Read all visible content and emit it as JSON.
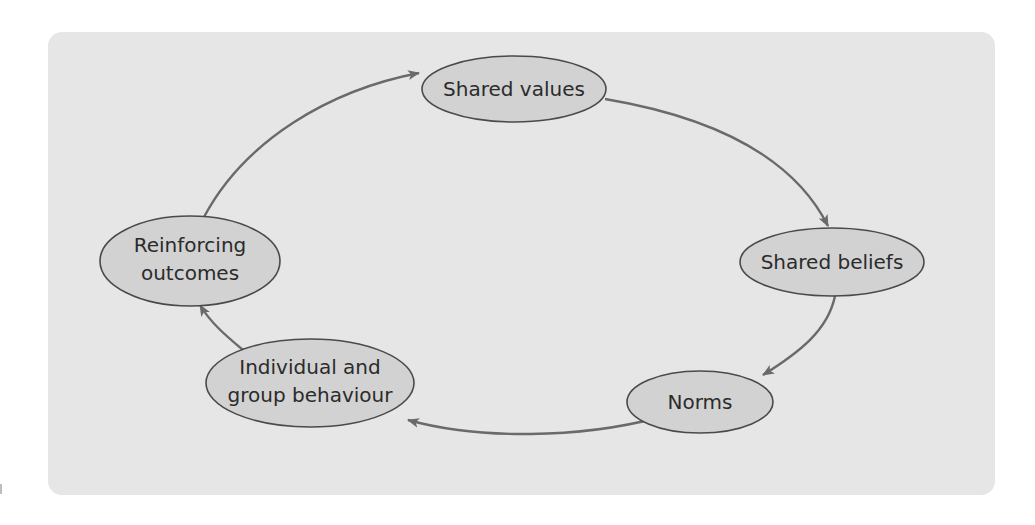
{
  "diagram": {
    "type": "cycle",
    "colors": {
      "panel": "#e6e6e6",
      "node_fill": "#d2d2d2",
      "node_stroke": "#4a4a4a",
      "edge": "#6a6a6a",
      "text": "#2b2b2b"
    },
    "nodes": [
      {
        "id": "shared-values",
        "lines": [
          "Shared values"
        ]
      },
      {
        "id": "shared-beliefs",
        "lines": [
          "Shared beliefs"
        ]
      },
      {
        "id": "norms",
        "lines": [
          "Norms"
        ]
      },
      {
        "id": "behaviour",
        "lines": [
          "Individual and",
          "group behaviour"
        ]
      },
      {
        "id": "outcomes",
        "lines": [
          "Reinforcing",
          "outcomes"
        ]
      }
    ],
    "edges": [
      {
        "from": "shared-values",
        "to": "shared-beliefs"
      },
      {
        "from": "shared-beliefs",
        "to": "norms"
      },
      {
        "from": "norms",
        "to": "behaviour"
      },
      {
        "from": "behaviour",
        "to": "outcomes"
      },
      {
        "from": "outcomes",
        "to": "shared-values"
      }
    ]
  }
}
